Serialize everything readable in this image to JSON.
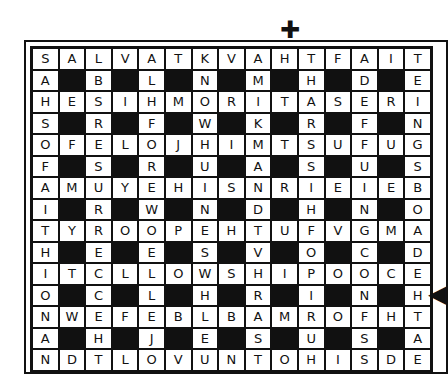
{
  "puzzle": {
    "type": "word-search",
    "rows": [
      "SALVATKVAHTFAIT",
      "A#B#L#N#M#H#D#E",
      "HESIHMORITASERI",
      "S#R#F#W#K#R#F#N",
      "OFELOJHIMTSUFUG",
      "F#S#R#U#A#S#U#S",
      "AMUYEHISNRIEIEB",
      "I#R#W#N#D#H#N#O",
      "TYROOPEHTUFVGMA",
      "H#E#E#S#V#O#C#D",
      "ITCLLOWSHIPOOCE",
      "O#C#L#H#R#I#N#H",
      "NWEFEBLBAMROFHT",
      "A#H#J#E#S#U#S#A",
      "NDTLOVUNTOHISDE"
    ],
    "markers": {
      "top": "✚",
      "right": "◀"
    }
  }
}
